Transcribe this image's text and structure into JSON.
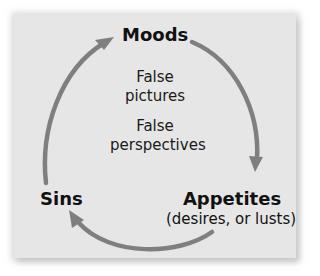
{
  "diagram": {
    "type": "cycle",
    "nodes": [
      {
        "id": "moods",
        "label": "Moods"
      },
      {
        "id": "appetites",
        "label": "Appetites",
        "sublabel": "(desires, or lusts)"
      },
      {
        "id": "sins",
        "label": "Sins"
      }
    ],
    "edges": [
      {
        "from": "moods",
        "to": "appetites"
      },
      {
        "from": "appetites",
        "to": "sins"
      },
      {
        "from": "sins",
        "to": "moods"
      }
    ],
    "center_notes": [
      "False",
      "pictures",
      "False",
      "perspectives"
    ],
    "colors": {
      "panel": "#e6e6e6",
      "arrow": "#7f7f7f",
      "text": "#111111"
    }
  }
}
